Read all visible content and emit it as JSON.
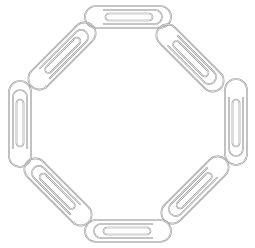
{
  "image": {
    "subject": "paperclip-ring",
    "clip_count": 8,
    "arrangement": "octagon",
    "colors": {
      "background": "#ffffff",
      "stroke": "#8a8a8a"
    },
    "clips": [
      {
        "cx": 128,
        "cy": 17,
        "angle": 0
      },
      {
        "cx": 190,
        "cy": 58,
        "angle": 45
      },
      {
        "cx": 236,
        "cy": 122,
        "angle": 90
      },
      {
        "cx": 195,
        "cy": 190,
        "angle": 135
      },
      {
        "cx": 128,
        "cy": 231,
        "angle": 180
      },
      {
        "cx": 58,
        "cy": 192,
        "angle": 225
      },
      {
        "cx": 20,
        "cy": 124,
        "angle": 270
      },
      {
        "cx": 62,
        "cy": 56,
        "angle": 315
      }
    ]
  }
}
